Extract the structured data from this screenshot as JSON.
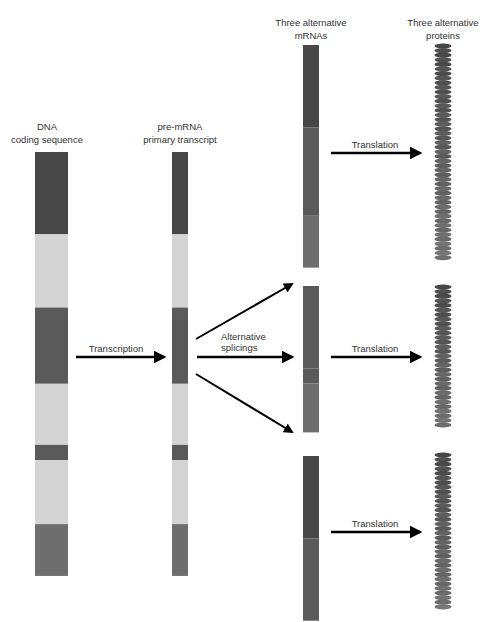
{
  "colors": {
    "exon_dark": "#474747",
    "exon_mid": "#5a5a5a",
    "exon_light": "#6e6e6e",
    "intron": "#d4d4d4",
    "arrow": "#000000"
  },
  "columns": {
    "dna": {
      "line1": "DNA",
      "line2": "coding sequence"
    },
    "pre_mrna": {
      "line1": "pre-mRNA",
      "line2": "primary transcript"
    },
    "mrnas": {
      "line1": "Three alternative",
      "line2": "mRNAs"
    },
    "proteins": {
      "line1": "Three alternative",
      "line2": "proteins"
    }
  },
  "steps": {
    "transcription": "Transcription",
    "splicing_line1": "Alternative",
    "splicing_line2": "splicings",
    "translation": "Translation"
  },
  "gene_segments": [
    {
      "type": "exon",
      "name": "exon-1",
      "shade": "exon_dark",
      "length": 27
    },
    {
      "type": "intron",
      "name": "intron-1",
      "shade": "intron",
      "length": 24
    },
    {
      "type": "exon",
      "name": "exon-2",
      "shade": "exon_mid",
      "length": 25
    },
    {
      "type": "intron",
      "name": "intron-2",
      "shade": "intron",
      "length": 20
    },
    {
      "type": "exon",
      "name": "exon-3",
      "shade": "exon_mid",
      "length": 5
    },
    {
      "type": "intron",
      "name": "intron-3",
      "shade": "intron",
      "length": 21
    },
    {
      "type": "exon",
      "name": "exon-4",
      "shade": "exon_light",
      "length": 17
    }
  ],
  "mrnas": [
    {
      "name": "mrna-1",
      "exons": [
        {
          "exon": "exon-1",
          "shade": "exon_dark",
          "length": 27
        },
        {
          "exon": "exon-2",
          "shade": "exon_mid",
          "length": 29
        },
        {
          "exon": "exon-4",
          "shade": "exon_light",
          "length": 17
        }
      ]
    },
    {
      "name": "mrna-2",
      "exons": [
        {
          "exon": "exon-2",
          "shade": "exon_mid",
          "length": 27
        },
        {
          "exon": "exon-3",
          "shade": "exon_mid",
          "length": 5
        },
        {
          "exon": "exon-4",
          "shade": "exon_light",
          "length": 16
        }
      ]
    },
    {
      "name": "mrna-3",
      "exons": [
        {
          "exon": "exon-1",
          "shade": "exon_dark",
          "length": 27
        },
        {
          "exon": "exon-4",
          "shade": "exon_mid",
          "length": 27
        }
      ]
    }
  ],
  "proteins": [
    {
      "name": "protein-1"
    },
    {
      "name": "protein-2"
    },
    {
      "name": "protein-3"
    }
  ]
}
